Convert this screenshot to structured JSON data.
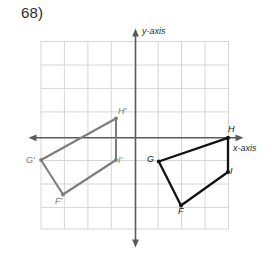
{
  "problem": {
    "number": "68)"
  },
  "colors": {
    "grid": "#d4d4d4",
    "axis": "#5a5a5a",
    "preimage": "#121212",
    "image": "#7d7d7d",
    "text": "#2b2b2b"
  },
  "axes": {
    "y_label": "y-axis",
    "x_label": "x-axis",
    "origin": {
      "x": 135.5,
      "y": 137.8
    },
    "cell": 23.4,
    "grid_bounds": {
      "left": 41,
      "top": 41.5,
      "right": 229,
      "bottom": 229
    }
  },
  "figures": [
    {
      "name": "preimage-FGHI",
      "style": "dark",
      "closed": true,
      "vertices": [
        {
          "label": "F",
          "x": 181.0,
          "y": 205.5
        },
        {
          "label": "G",
          "x": 158.8,
          "y": 161.5
        },
        {
          "label": "H",
          "x": 228.0,
          "y": 137.8
        },
        {
          "label": "I",
          "x": 228.0,
          "y": 172.0
        }
      ]
    },
    {
      "name": "image-FGHI-prime",
      "style": "light",
      "closed": true,
      "vertices": [
        {
          "label": "F'",
          "x": 63.0,
          "y": 194.5
        },
        {
          "label": "G'",
          "x": 41.0,
          "y": 160.0
        },
        {
          "label": "H'",
          "x": 116.0,
          "y": 118.5
        },
        {
          "label": "I'",
          "x": 116.0,
          "y": 160.0
        }
      ]
    }
  ],
  "vertex_labels": {
    "H_prime": "H'",
    "I_prime": "I'",
    "G_prime": "G'",
    "F_prime": "F'",
    "H": "H",
    "I": "I",
    "G": "G",
    "F": "F"
  }
}
